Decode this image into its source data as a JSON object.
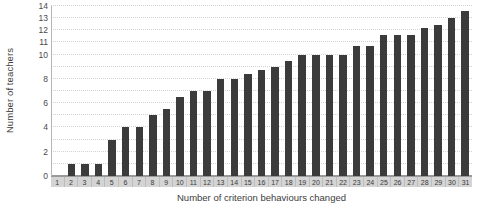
{
  "chart_data": {
    "type": "bar",
    "title": "",
    "xlabel": "Number of criterion behaviours changed",
    "ylabel": "Number of teachers",
    "categories": [
      "1",
      "2",
      "3",
      "4",
      "5",
      "6",
      "7",
      "8",
      "9",
      "10",
      "11",
      "12",
      "13",
      "14",
      "15",
      "16",
      "17",
      "18",
      "19",
      "20",
      "21",
      "22",
      "23",
      "24",
      "25",
      "26",
      "27",
      "28",
      "29",
      "30",
      "31"
    ],
    "values": [
      0,
      1,
      1,
      1,
      3,
      4,
      4,
      5,
      5.5,
      6.5,
      7,
      7,
      8,
      8,
      8.4,
      8.7,
      9,
      9.5,
      10,
      10,
      10,
      10,
      10.7,
      10.7,
      11.6,
      11.6,
      11.6,
      12.2,
      12.4,
      13,
      13.6
    ],
    "ylim": [
      0,
      14
    ],
    "ytick_values": [
      0,
      1,
      2,
      3,
      4,
      5,
      6,
      7,
      8,
      9,
      10,
      11,
      12,
      13,
      14
    ],
    "ytick_labels": [
      "0",
      "1",
      "2",
      "3",
      "4",
      "5",
      "6",
      "7",
      "8",
      "9",
      "10",
      "11",
      "12",
      "13",
      "14"
    ],
    "ytick_labels_visible": [
      "0",
      "",
      "2",
      "",
      "4",
      "",
      "6",
      "",
      "8",
      "",
      "10",
      "11",
      "12",
      "13",
      "14"
    ],
    "grid": true,
    "grid_style": "dotted-horizontal",
    "legend": "none",
    "bar_color": "#3b3b3b",
    "gridline_color": "#d2d2d2",
    "axis_color": "#9a9a9a",
    "xtick_band_color": "#d4d4d4",
    "plot_background": "#ffffff"
  }
}
